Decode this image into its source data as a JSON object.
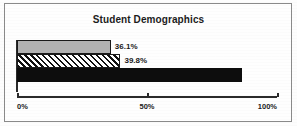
{
  "chart": {
    "title": "Student Demographics"
  },
  "chart_data": {
    "type": "bar",
    "orientation": "horizontal",
    "title": "Student Demographics",
    "xlabel": "",
    "ylabel": "",
    "xlim": [
      0,
      100
    ],
    "grid": false,
    "legend": "none",
    "categories": [
      "Series 1",
      "Series 2",
      "Series 3"
    ],
    "values": [
      36.1,
      39.8,
      86.7
    ],
    "value_labels": [
      "36.1%",
      "39.8%",
      "86.7%"
    ],
    "bar_styles": [
      "solid-gray",
      "diagonal-hatch",
      "solid-black"
    ],
    "label_placement": [
      "outside",
      "outside",
      "inside"
    ],
    "axis": {
      "ticks": [
        0,
        50,
        100
      ],
      "tick_labels": [
        "0%",
        "50%",
        "100%"
      ]
    },
    "colors": {
      "bar_gray": "#b2b2b2",
      "bar_black": "#0d0d0d",
      "hatch_line": "#111111",
      "hatch_background": "#ffffff",
      "outline": "#1a1a1a",
      "axis": "#2a2a2a",
      "text": "#1c1c1c",
      "inside_label_text": "#ffffff",
      "frame": "#8a8a8a",
      "background": "#fefefe"
    }
  }
}
